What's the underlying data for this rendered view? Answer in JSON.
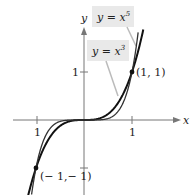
{
  "chart_data": {
    "type": "line",
    "title": "",
    "xlabel": "x",
    "ylabel": "y",
    "xlim": [
      -1.5,
      2.0
    ],
    "ylim": [
      -1.5,
      2.3
    ],
    "grid": false,
    "legend": "callout boxes",
    "xticks": [
      {
        "value": -1,
        "label": "1"
      },
      {
        "value": 1,
        "label": "1"
      }
    ],
    "yticks": [
      {
        "value": 1,
        "label": "1"
      },
      {
        "value": -1,
        "label": ""
      }
    ],
    "series": [
      {
        "name": "y = x^5",
        "label_text": "y = x",
        "exponent": "5",
        "function": "x^5",
        "x": [
          -1.1,
          -1,
          -0.8,
          -0.6,
          -0.4,
          -0.2,
          0,
          0.2,
          0.4,
          0.6,
          0.8,
          1,
          1.1
        ],
        "values": [
          -1.61,
          -1,
          -0.33,
          -0.08,
          -0.01,
          0,
          0,
          0,
          0.01,
          0.08,
          0.33,
          1,
          1.61
        ]
      },
      {
        "name": "y = x^3",
        "label_text": "y = x",
        "exponent": "3",
        "function": "x^3",
        "x": [
          -1.1,
          -1,
          -0.8,
          -0.6,
          -0.4,
          -0.2,
          0,
          0.2,
          0.4,
          0.6,
          0.8,
          1,
          1.1
        ],
        "values": [
          -1.33,
          -1,
          -0.51,
          -0.22,
          -0.06,
          -0.01,
          0,
          0.01,
          0.06,
          0.22,
          0.51,
          1,
          1.33
        ]
      }
    ],
    "annotations": [
      {
        "point": [
          1,
          1
        ],
        "text": "(1, 1)"
      },
      {
        "point": [
          -1,
          -1
        ],
        "text": "(− 1,− 1)"
      }
    ]
  },
  "labels": {
    "x_axis": "x",
    "y_axis": "y",
    "x_tick_neg": "1",
    "x_tick_pos": "1",
    "y_tick_pos": "1",
    "x5_base": "y = x",
    "x5_exp": "5",
    "x3_base": "y = x",
    "x3_exp": "3",
    "pt_pos": "(1, 1)",
    "pt_neg": "(− 1,− 1)"
  }
}
